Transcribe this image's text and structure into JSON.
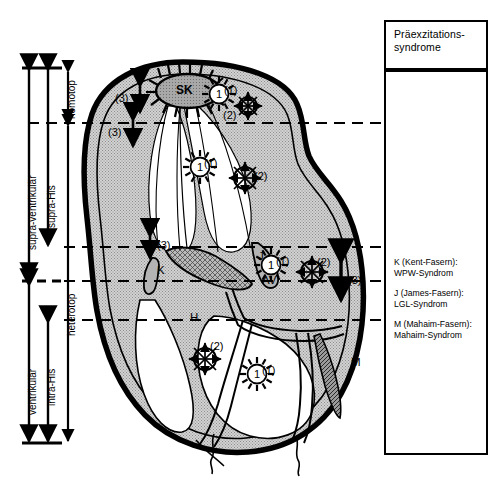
{
  "diagram": {
    "legend_panel": {
      "header_lines": [
        "Präexzitations-",
        "syndrome"
      ],
      "entries": [
        {
          "key": "K",
          "line1": "K (Kent-Fasern):",
          "line2": "WPW-Syndrom"
        },
        {
          "key": "J",
          "line1": "J (James-Fasern):",
          "line2": "LGL-Syndrom"
        },
        {
          "key": "M",
          "line1": "M (Mahaim-Fasern):",
          "line2": "Mahaim-Syndrom"
        }
      ]
    },
    "axis_labels": {
      "outer_top": "supra-ventrikulär",
      "inner_top": "supra-His",
      "outer_bottom": "ventrikulär",
      "inner_bottom": "intra-His",
      "right_top": "nomotop",
      "right_bottom": "heterotop"
    },
    "structures": [
      {
        "id": "SK",
        "label": "SK",
        "desc": "sinus-node"
      },
      {
        "id": "AV",
        "label": "AV",
        "desc": "av-node"
      },
      {
        "id": "H",
        "label": "H",
        "desc": "his-bundle"
      },
      {
        "id": "K",
        "label": "K",
        "desc": "kent-fiber"
      },
      {
        "id": "J",
        "label": "J",
        "desc": "james-fiber"
      },
      {
        "id": "M",
        "label": "M",
        "desc": "mahaim-fiber"
      }
    ],
    "markers": {
      "type1": {
        "label": "(1)",
        "glyph": "starburst-circled-one",
        "count": 4
      },
      "type2": {
        "label": "(2)",
        "glyph": "circle-radial-arrows",
        "count": 3
      },
      "type3": {
        "label": "(3)",
        "glyph": "double-headed-arrow",
        "count": 3
      }
    },
    "marker_instances": [
      {
        "type": "1",
        "label": "(1)",
        "x": 219,
        "y": 94
      },
      {
        "type": "1",
        "label": "(1)",
        "x": 200,
        "y": 167
      },
      {
        "type": "1",
        "label": "(1)",
        "x": 271,
        "y": 265
      },
      {
        "type": "1",
        "label": "(1)",
        "x": 257,
        "y": 374
      },
      {
        "type": "2",
        "label": "(2)",
        "x": 248,
        "y": 106
      },
      {
        "type": "2",
        "label": "(2)",
        "x": 245,
        "y": 178
      },
      {
        "type": "2",
        "label": "(2)",
        "x": 312,
        "y": 272
      },
      {
        "type": "2",
        "label": "(2)",
        "x": 205,
        "y": 359
      },
      {
        "type": "3",
        "label": "(3)",
        "x": 123,
        "y": 99
      },
      {
        "type": "3",
        "label": "(3)",
        "x": 116,
        "y": 133
      },
      {
        "type": "3",
        "label": "(3)",
        "x": 133,
        "y": 248
      },
      {
        "type": "3",
        "label": "(3)",
        "x": 349,
        "y": 281
      }
    ],
    "dashed_levels": [
      {
        "name": "nomotop-heterotop-boundary",
        "y": 123
      },
      {
        "name": "atrial-level",
        "y": 247
      },
      {
        "name": "av-level",
        "y": 281
      },
      {
        "name": "his-level",
        "y": 320
      }
    ],
    "colors": {
      "ink": "#000000",
      "tissue_fill": "#c9c9c9",
      "chamber_fill": "#ffffff",
      "node_fill": "#9a9a9a",
      "fiber_fill": "#b0b0b0",
      "mahaim_fill": "#707070",
      "panel_bg": "#ffffff"
    }
  }
}
